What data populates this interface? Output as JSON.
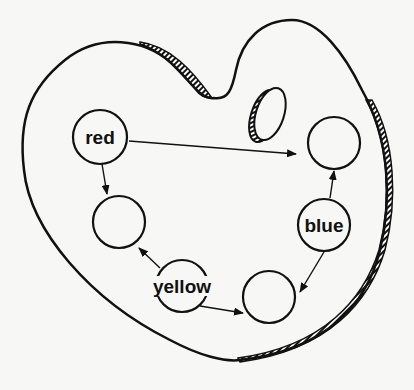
{
  "diagram": {
    "type": "paint-palette-color-mixing",
    "stroke_color": "#111111",
    "background": "#f7f7f5",
    "nodes": [
      {
        "id": "red",
        "label": "red",
        "cx": 100,
        "cy": 137
      },
      {
        "id": "top-right",
        "label": "",
        "cx": 334,
        "cy": 143
      },
      {
        "id": "left",
        "label": "",
        "cx": 119,
        "cy": 222
      },
      {
        "id": "blue",
        "label": "blue",
        "cx": 324,
        "cy": 225
      },
      {
        "id": "yellow",
        "label": "yellow",
        "cx": 182,
        "cy": 286
      },
      {
        "id": "bottom",
        "label": "",
        "cx": 269,
        "cy": 297
      }
    ],
    "edges": [
      {
        "from": "red",
        "to": "top-right"
      },
      {
        "from": "red",
        "to": "left"
      },
      {
        "from": "blue",
        "to": "top-right"
      },
      {
        "from": "blue",
        "to": "bottom"
      },
      {
        "from": "yellow",
        "to": "left"
      },
      {
        "from": "yellow",
        "to": "bottom"
      }
    ]
  },
  "labels": {
    "red": "red",
    "blue": "blue",
    "yellow": "yellow"
  }
}
